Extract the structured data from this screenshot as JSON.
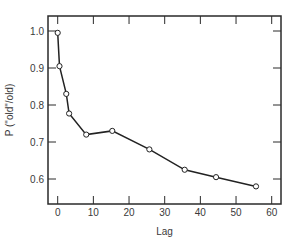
{
  "chart_data": {
    "type": "line",
    "title": "",
    "xlabel": "Lag",
    "ylabel": "P (\"old\"/old)",
    "xlim": [
      -2,
      63
    ],
    "ylim": [
      0.54,
      1.04
    ],
    "x_ticks": [
      0,
      10,
      20,
      30,
      40,
      50,
      60
    ],
    "y_ticks": [
      0.6,
      0.7,
      0.8,
      0.9,
      1.0
    ],
    "x_tick_labels": [
      "0",
      "10",
      "20",
      "30",
      "40",
      "50",
      "60"
    ],
    "y_tick_labels": [
      "0.6",
      "0.7",
      "0.8",
      "0.9",
      "1.0"
    ],
    "grid": false,
    "legend": null,
    "marker": "open-circle",
    "series": [
      {
        "name": "P(\"old\"/old)",
        "x": [
          0,
          0.5,
          2.4,
          3.2,
          8,
          15.3,
          25.7,
          35.6,
          44.4,
          55.6
        ],
        "values": [
          0.995,
          0.905,
          0.83,
          0.777,
          0.72,
          0.73,
          0.68,
          0.625,
          0.605,
          0.58
        ]
      }
    ],
    "colors": {
      "line": "#222222",
      "axis": "#2a2a2a",
      "marker_fill": "#ffffff"
    }
  }
}
